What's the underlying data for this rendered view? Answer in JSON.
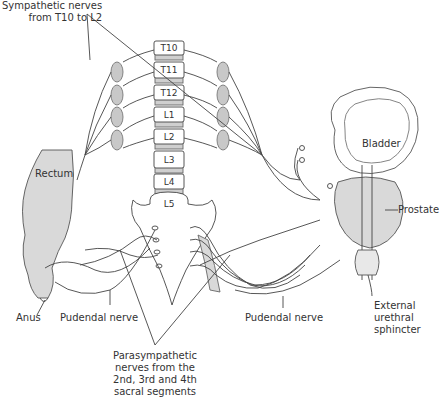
{
  "labels": {
    "sympathetic": [
      "Sympathetic nerves",
      "from T10 to L2"
    ],
    "rectum": "Rectum",
    "bladder": "Bladder",
    "prostate": "Prostate",
    "external_sphincter": [
      "External",
      "urethral",
      "sphincter"
    ],
    "anus": "Anus",
    "pudendal_left": "Pudendal nerve",
    "pudendal_right": "Pudendal nerve",
    "parasympathetic": [
      "Parasympathetic",
      "nerves from the",
      "2nd, 3rd and 4th",
      "sacral segments"
    ]
  },
  "vertebrae": [
    "T10",
    "T11",
    "T12",
    "L1",
    "L2",
    "L3",
    "L4",
    "L5"
  ],
  "colors": {
    "line": "#444444",
    "organ_fill": "#d9d9d9",
    "ganglion_fill": "#c8c8c8",
    "bone_fill": "#ffffff",
    "disc_fill": "#cfcfcf"
  }
}
